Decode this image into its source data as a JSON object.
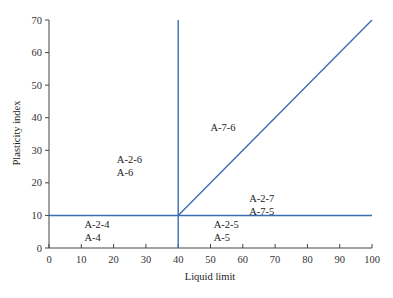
{
  "chart_data": {
    "type": "line",
    "title": "",
    "xlabel": "Liquid limit",
    "ylabel": "Plasticity index",
    "xlim": [
      0,
      100
    ],
    "ylim": [
      0,
      70
    ],
    "xticks": [
      0,
      10,
      20,
      30,
      40,
      50,
      60,
      70,
      80,
      90,
      100
    ],
    "yticks": [
      0,
      10,
      20,
      30,
      40,
      50,
      60,
      70
    ],
    "grid": false,
    "colors": {
      "line": "#3b6db4",
      "axis": "#444444"
    },
    "lines": [
      {
        "name": "horizontal-boundary",
        "points": [
          [
            0,
            10
          ],
          [
            100,
            10
          ]
        ]
      },
      {
        "name": "vertical-boundary",
        "points": [
          [
            40,
            0
          ],
          [
            40,
            70
          ]
        ]
      },
      {
        "name": "diagonal-boundary",
        "points": [
          [
            40,
            10
          ],
          [
            100,
            70
          ]
        ]
      }
    ],
    "annotations": [
      {
        "lines": [
          "A-2-6",
          "A-6"
        ],
        "x": 21,
        "y": 26
      },
      {
        "lines": [
          "A-7-6"
        ],
        "x": 50,
        "y": 36
      },
      {
        "lines": [
          "A-2-7",
          "A-7-5"
        ],
        "x": 62,
        "y": 14
      },
      {
        "lines": [
          "A-2-4",
          "A-4"
        ],
        "x": 11,
        "y": 6
      },
      {
        "lines": [
          "A-2-5",
          "A-5"
        ],
        "x": 51,
        "y": 6
      }
    ]
  }
}
